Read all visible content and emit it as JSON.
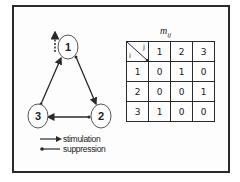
{
  "graph": {
    "nodes": [
      {
        "id": "1",
        "label": "1",
        "cx": 68,
        "cy": 47
      },
      {
        "id": "2",
        "label": "2",
        "cx": 100,
        "cy": 116
      },
      {
        "id": "3",
        "label": "3",
        "cx": 38,
        "cy": 116
      }
    ],
    "edges": [
      {
        "from": "1",
        "to": "2",
        "type": "stimulation"
      },
      {
        "from": "2",
        "to": "3",
        "type": "stimulation"
      },
      {
        "from": "3",
        "to": "1",
        "type": "stimulation"
      }
    ],
    "external_input": {
      "node": "1",
      "style": "dashed-arrow-up"
    }
  },
  "legend": {
    "items": [
      {
        "symbol": "arrow",
        "label": "stimulation"
      },
      {
        "symbol": "dot-line",
        "label": "suppression"
      }
    ]
  },
  "matrix": {
    "title_main": "m",
    "title_sub": "ij",
    "row_header_label": "i",
    "col_header_label": "j",
    "col_headers": [
      "1",
      "2",
      "3"
    ],
    "rows": [
      {
        "header": "1",
        "values": [
          "0",
          "1",
          "0"
        ]
      },
      {
        "header": "2",
        "values": [
          "0",
          "0",
          "1"
        ]
      },
      {
        "header": "3",
        "values": [
          "1",
          "0",
          "0"
        ]
      }
    ]
  },
  "colors": {
    "stroke": "#2a2a2a",
    "node_stroke": "#555555",
    "background": "#ffffff"
  }
}
